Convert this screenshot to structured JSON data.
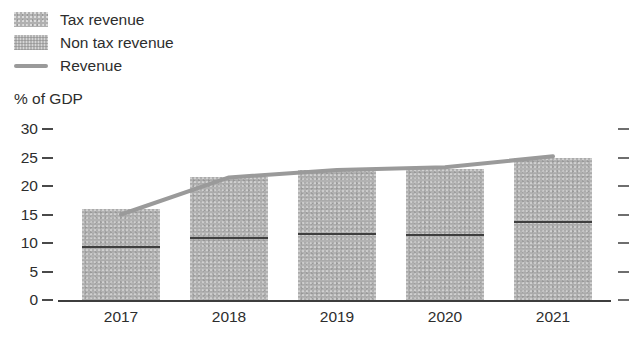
{
  "legend": {
    "items": [
      {
        "label": "Tax revenue",
        "marker": "square-swatch",
        "color": "#b0b0b0"
      },
      {
        "label": "Non tax revenue",
        "marker": "square-swatch",
        "color": "#b4b4b4"
      },
      {
        "label": "Revenue",
        "marker": "line-swatch",
        "color": "#9a9a9a"
      }
    ]
  },
  "axis_unit_label": "% of GDP",
  "chart_data": {
    "type": "bar",
    "title": "",
    "subtitle": "",
    "xlabel": "",
    "ylabel": "% of GDP",
    "categories": [
      "2017",
      "2018",
      "2019",
      "2020",
      "2021"
    ],
    "x": [
      2017,
      2018,
      2019,
      2020,
      2021
    ],
    "ylim": [
      0,
      30
    ],
    "yticks": [
      0,
      5,
      10,
      15,
      20,
      25,
      30
    ],
    "ytick_labels": [
      "0",
      "5",
      "10",
      "15",
      "20",
      "25",
      "30"
    ],
    "grid": false,
    "stacked": true,
    "legend_position": "above-left",
    "right_axis_ticks": [
      0,
      5,
      10,
      15,
      20,
      25,
      30
    ],
    "series": [
      {
        "name": "Tax revenue",
        "type": "bar",
        "stack": "revenue",
        "color": "#b2b2b2",
        "values": [
          9.5,
          11.0,
          11.8,
          11.5,
          13.8
        ]
      },
      {
        "name": "Non tax revenue",
        "type": "bar",
        "stack": "revenue",
        "color": "#b2b2b2",
        "values": [
          6.5,
          10.5,
          11.0,
          11.5,
          11.2
        ]
      },
      {
        "name": "Revenue",
        "type": "line",
        "color": "#9a9a9a",
        "values": [
          15.0,
          21.5,
          22.8,
          23.3,
          25.2
        ]
      }
    ],
    "bar_totals": [
      16.0,
      21.5,
      22.8,
      23.0,
      25.0
    ]
  }
}
